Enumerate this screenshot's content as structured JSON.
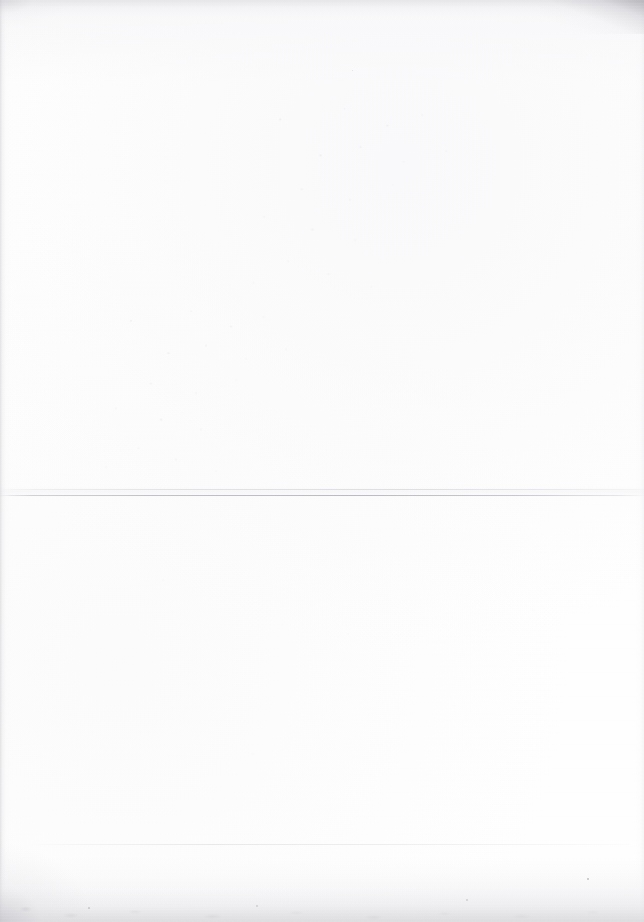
{
  "page": {
    "kind": "scanned-document-page",
    "width": 644,
    "height": 922,
    "background_color": "#fefefe",
    "visible_text": "",
    "description": "Blank scanned sheet of paper with two faint horizontal ruled lines and soft grey scan-edge shadows."
  },
  "paper": {
    "base_color": "#fefefe",
    "tone_color": "#f8f8fa",
    "edge_shadow_color": "#cdcdd0",
    "bottom_edge_color": "#cecdd2",
    "corner_notch_color": "#96969d"
  },
  "rules": [
    {
      "id": "primary-upper",
      "label": "upper hairline of main rule",
      "y": 489,
      "x": 0,
      "width": 644,
      "thickness": 1,
      "color": "#d8d8dd"
    },
    {
      "id": "primary-lower",
      "label": "main horizontal rule",
      "y": 495,
      "x": 0,
      "width": 644,
      "thickness": 1,
      "color": "#b7b7be"
    },
    {
      "id": "secondary",
      "label": "lower faint rule",
      "y": 844,
      "x": 30,
      "width": 600,
      "thickness": 1,
      "color": "#e3e3e8"
    }
  ],
  "marks": [
    {
      "id": "speckles-upper",
      "label": "faint bleed-through specks",
      "x": 232,
      "y": 96,
      "width": 268,
      "height": 212
    },
    {
      "id": "speckles-mid",
      "label": "faint residue specks",
      "x": 86,
      "y": 300,
      "width": 250,
      "height": 190
    },
    {
      "id": "speckles-lower",
      "label": "sparse residue specks",
      "x": 40,
      "y": 520,
      "width": 560,
      "height": 300
    }
  ],
  "flecks": [
    {
      "x": 587,
      "y": 878,
      "size": 2.0,
      "color": "#9a9aa2"
    },
    {
      "x": 466,
      "y": 899,
      "size": 1.6,
      "color": "#b0b0b8"
    },
    {
      "x": 256,
      "y": 905,
      "size": 1.8,
      "color": "#a8a8b0"
    },
    {
      "x": 88,
      "y": 907,
      "size": 1.7,
      "color": "#a2a2aa"
    },
    {
      "x": 352,
      "y": 70,
      "size": 1.4,
      "color": "#d0d0d8"
    }
  ]
}
